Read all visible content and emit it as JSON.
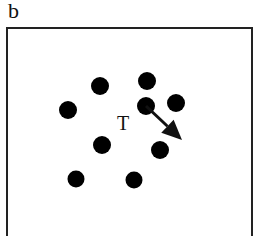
{
  "figure": {
    "panel_label": "b",
    "frame": {
      "x": 7,
      "y": 28,
      "width": 245,
      "height": 215,
      "stroke": "#222222"
    },
    "dots": [
      {
        "cx": 100,
        "cy": 86,
        "r": 9
      },
      {
        "cx": 68,
        "cy": 110,
        "r": 9
      },
      {
        "cx": 147,
        "cy": 81,
        "r": 9
      },
      {
        "cx": 146,
        "cy": 106,
        "r": 9
      },
      {
        "cx": 176,
        "cy": 103,
        "r": 9
      },
      {
        "cx": 102,
        "cy": 145,
        "r": 9
      },
      {
        "cx": 160,
        "cy": 150,
        "r": 9
      },
      {
        "cx": 76,
        "cy": 179,
        "r": 8.5
      },
      {
        "cx": 134,
        "cy": 180,
        "r": 8.5
      }
    ],
    "arrow": {
      "label": "T",
      "label_x": 117,
      "label_y": 130,
      "from": {
        "x": 146,
        "y": 106
      },
      "to": {
        "x": 182,
        "y": 140
      },
      "color": "#111111"
    },
    "dot_color": "#000000"
  }
}
